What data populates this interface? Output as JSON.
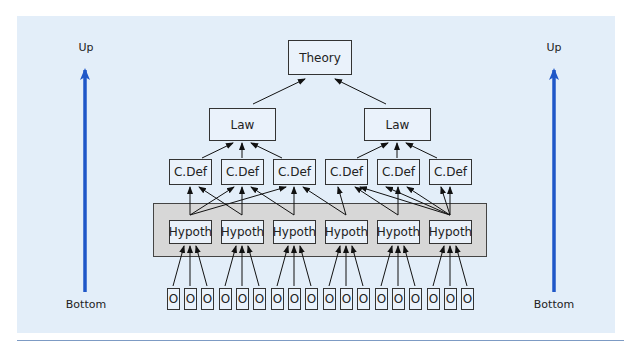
{
  "diagram": {
    "type": "hierarchy",
    "left_axis": {
      "top_label": "Up",
      "bottom_label": "Bottom",
      "color": "#1f57c8"
    },
    "right_axis": {
      "top_label": "Up",
      "bottom_label": "Bottom",
      "color": "#1f57c8"
    },
    "levels": {
      "theory": [
        "Theory"
      ],
      "laws": [
        "Law",
        "Law"
      ],
      "constitutive_definitions": [
        "C.Def",
        "C.Def",
        "C.Def",
        "C.Def",
        "C.Def",
        "C.Def"
      ],
      "hypotheses": [
        "Hypoth",
        "Hypoth",
        "Hypoth",
        "Hypoth",
        "Hypoth",
        "Hypoth"
      ],
      "observations": [
        "O",
        "O",
        "O",
        "O",
        "O",
        "O",
        "O",
        "O",
        "O",
        "O",
        "O",
        "O",
        "O",
        "O",
        "O",
        "O",
        "O",
        "O"
      ]
    },
    "colors": {
      "panel_background": "#e3eef9",
      "hypothesis_band": "#d7d7d7",
      "rule": "#7d9bc4"
    }
  }
}
